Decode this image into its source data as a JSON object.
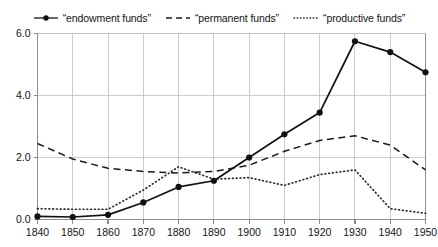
{
  "chart_data": {
    "type": "line",
    "title": "",
    "subtitle": "",
    "xlabel": "",
    "ylabel": "",
    "x": [
      1840,
      1850,
      1860,
      1870,
      1880,
      1890,
      1900,
      1910,
      1920,
      1930,
      1940,
      1950
    ],
    "xtick_labels": [
      "1840",
      "1850",
      "1860",
      "1870",
      "1880",
      "1890",
      "1900",
      "1910",
      "1920",
      "1930",
      "1940",
      "1950"
    ],
    "ytick_labels": [
      "0.0",
      "2.0",
      "4.0",
      "6.0"
    ],
    "yticks": [
      0.0,
      2.0,
      4.0,
      6.0
    ],
    "xlim": [
      1840,
      1950
    ],
    "ylim": [
      0.0,
      6.0
    ],
    "grid": "both",
    "legend_position": "top-center",
    "series": [
      {
        "name": "“endowment funds”",
        "style": "solid-with-markers",
        "color": "#111111",
        "marker": "circle",
        "values": [
          0.1,
          0.08,
          0.15,
          0.55,
          1.05,
          1.25,
          2.0,
          2.75,
          3.45,
          5.75,
          5.4,
          4.75
        ]
      },
      {
        "name": "“permanent funds”",
        "style": "dashed",
        "color": "#1a1a1a",
        "marker": "none",
        "values": [
          2.45,
          1.95,
          1.65,
          1.55,
          1.5,
          1.55,
          1.75,
          2.2,
          2.55,
          2.7,
          2.4,
          1.6
        ]
      },
      {
        "name": "“productive funds”",
        "style": "dotted",
        "color": "#2a2a2a",
        "marker": "none",
        "values": [
          0.35,
          0.33,
          0.33,
          0.95,
          1.7,
          1.3,
          1.35,
          1.1,
          1.45,
          1.6,
          0.35,
          0.2
        ]
      }
    ]
  },
  "colors": {
    "background": "#ffffff",
    "grid": "#bfbfbf",
    "axis": "#8c8c8c",
    "text": "#141414",
    "series_endowment": "#111111",
    "series_permanent": "#1a1a1a",
    "series_productive": "#2a2a2a"
  },
  "legend": {
    "items": [
      {
        "label": "“endowment funds”",
        "icon": "solid-line-dot-marker-icon"
      },
      {
        "label": "“permanent funds”",
        "icon": "dashed-line-icon"
      },
      {
        "label": "“productive funds”",
        "icon": "dotted-line-icon"
      }
    ]
  }
}
